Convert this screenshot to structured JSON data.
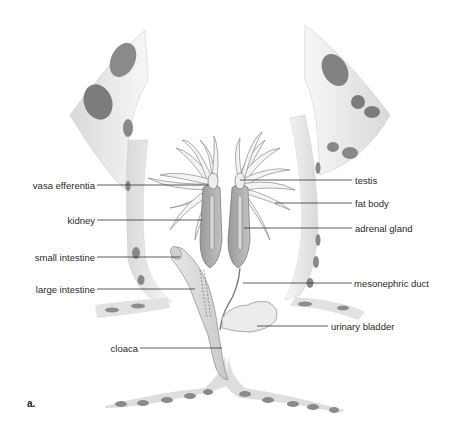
{
  "figure": {
    "panel_letter": "a."
  },
  "labels_left": [
    {
      "id": "vasa-efferentia",
      "text": "vasa efferentia"
    },
    {
      "id": "kidney",
      "text": "kidney"
    },
    {
      "id": "small-intestine",
      "text": "small intestine"
    },
    {
      "id": "large-intestine",
      "text": "large intestine"
    },
    {
      "id": "cloaca",
      "text": "cloaca"
    }
  ],
  "labels_right": [
    {
      "id": "testis",
      "text": "testis"
    },
    {
      "id": "fat-body",
      "text": "fat body"
    },
    {
      "id": "adrenal-gland",
      "text": "adrenal gland"
    },
    {
      "id": "mesonephric-duct",
      "text": "mesonephric duct"
    },
    {
      "id": "urinary-bladder",
      "text": "urinary bladder"
    }
  ],
  "colors": {
    "skin_light": "#ececec",
    "skin_spot": "#7a7a7a",
    "organ_fill": "#e2e2e2",
    "kidney_fill": "#a8a8a8",
    "leader_line": "#333333",
    "text": "#2a2a2a"
  }
}
